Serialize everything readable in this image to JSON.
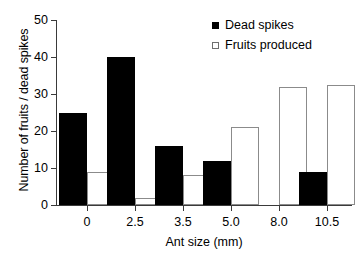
{
  "chart_data": {
    "type": "bar",
    "title": "",
    "xlabel": "Ant size (mm)",
    "ylabel": "Number of fruits / dead spikes",
    "categories": [
      "0",
      "2.5",
      "3.5",
      "5.0",
      "8.0",
      "10.5"
    ],
    "series": [
      {
        "name": "Dead spikes",
        "marker": "filled-square",
        "color": "#000000",
        "values": [
          25,
          40,
          16,
          12,
          0,
          9
        ]
      },
      {
        "name": "Fruits produced",
        "marker": "open-square",
        "color": "#ffffff",
        "values": [
          9,
          2,
          8,
          21,
          32,
          32.5
        ]
      }
    ],
    "ylim": [
      0,
      50
    ],
    "yticks": [
      "0",
      "10",
      "20",
      "30",
      "40",
      "50"
    ],
    "ytick_values": [
      0,
      10,
      20,
      30,
      40,
      50
    ],
    "grid": false,
    "legend_position": "top-right"
  },
  "legend": {
    "items": [
      {
        "label": "Dead spikes",
        "swatch": "filled-square"
      },
      {
        "label": "Fruits produced",
        "swatch": "open-square"
      }
    ]
  }
}
